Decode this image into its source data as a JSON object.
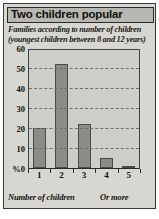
{
  "panel": {
    "title": "Two children popular",
    "subtitle_lines": [
      "Families according to number of children",
      "(youngest children between 8 and 12 years)"
    ],
    "footer_left": "Number of children",
    "footer_right": "Or more",
    "colors": {
      "panel_background": "#d8d6d0",
      "title_background": "#b9b7b1",
      "plot_background": "#cfcdc7",
      "bar_fill": "#8d8b86",
      "bar_border": "#4a4a46",
      "grid": "#6f6f6b",
      "text": "#111111"
    }
  },
  "chart_data": {
    "type": "bar",
    "title": "Two children popular",
    "subtitle": "Families according to number of children (youngest children between 8 and 12 years)",
    "categories": [
      "1",
      "2",
      "3",
      "4",
      "5"
    ],
    "values": [
      20,
      52,
      22,
      5,
      1
    ],
    "xlabel": "Number of children",
    "xlabel_note": "Or more",
    "ylabel": "%",
    "ylim": [
      0,
      60
    ],
    "yticks": [
      0,
      10,
      20,
      30,
      40,
      50,
      60
    ],
    "ytick_labels": [
      "%0",
      "10",
      "20",
      "30",
      "40",
      "50",
      "60"
    ],
    "grid": true,
    "grid_axis": "y",
    "legend": false
  }
}
